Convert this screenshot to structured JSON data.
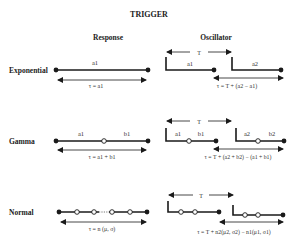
{
  "title": "TRIGGER",
  "columns": {
    "response": "Response",
    "oscillator": "Oscillator"
  },
  "rows": [
    {
      "name": "Exponential",
      "response": {
        "segment_labels": [
          "a1"
        ],
        "formula": "τ = a1"
      },
      "oscillator": {
        "period_label": "T",
        "pulse1_labels": [
          "a1"
        ],
        "pulse2_labels": [
          "a2"
        ],
        "formula": "τ = T + (a2 − a1)"
      }
    },
    {
      "name": "Gamma",
      "response": {
        "segment_labels": [
          "a1",
          "b1"
        ],
        "formula": "τ = a1 + b1"
      },
      "oscillator": {
        "period_label": "T",
        "pulse1_labels": [
          "a1",
          "b1"
        ],
        "pulse2_labels": [
          "a2",
          "b2"
        ],
        "formula": "τ = T + (a2 + b2) − (a1 + b1)"
      }
    },
    {
      "name": "Normal",
      "response": {
        "segment_labels": [],
        "formula": "τ = n (μ, σ)"
      },
      "oscillator": {
        "period_label": "T",
        "pulse1_labels": [],
        "pulse2_labels": [],
        "formula": "τ = T + n2(μ2, σ2) − n1(μ1, σ1)"
      }
    }
  ],
  "colors": {
    "ink": "#1a1a1a",
    "text": "#222222",
    "background": "#ffffff"
  }
}
